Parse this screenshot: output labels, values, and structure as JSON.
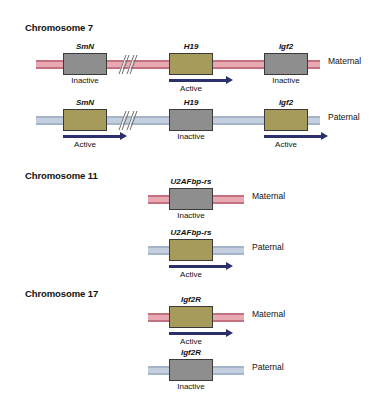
{
  "figure": {
    "background": "#ffffff",
    "colors": {
      "maternal_strand": "#e9a9b3",
      "maternal_strand_edge": "#c4727f",
      "paternal_strand": "#c3cedf",
      "paternal_strand_edge": "#a6b4c9",
      "active_gene_box": "#a79b5c",
      "inactive_gene_box": "#8e8e8e",
      "gene_box_border": "#3a3a3a",
      "arrow": "#2b2f6b",
      "text": "#111111"
    },
    "state_active": "Active",
    "state_inactive": "Inactive",
    "origin_maternal": "Maternal",
    "origin_paternal": "Paternal"
  },
  "sections": [
    {
      "heading": "Chromosome 7",
      "rows": [
        {
          "origin": "Maternal",
          "strand": "maternal",
          "has_break": true,
          "genes": [
            {
              "name": "SmN",
              "state": "Inactive",
              "arrow": false
            },
            {
              "name": "H19",
              "state": "Active",
              "arrow": true
            },
            {
              "name": "Igf2",
              "state": "Inactive",
              "arrow": false
            }
          ]
        },
        {
          "origin": "Paternal",
          "strand": "paternal",
          "has_break": true,
          "genes": [
            {
              "name": "SmN",
              "state": "Active",
              "arrow": true
            },
            {
              "name": "H19",
              "state": "Inactive",
              "arrow": false
            },
            {
              "name": "Igf2",
              "state": "Active",
              "arrow": true
            }
          ]
        }
      ]
    },
    {
      "heading": "Chromosome 11",
      "rows": [
        {
          "origin": "Maternal",
          "strand": "maternal",
          "has_break": false,
          "genes": [
            {
              "name": "U2AFbp-rs",
              "state": "Inactive",
              "arrow": false
            }
          ]
        },
        {
          "origin": "Paternal",
          "strand": "paternal",
          "has_break": false,
          "genes": [
            {
              "name": "U2AFbp-rs",
              "state": "Active",
              "arrow": true
            }
          ]
        }
      ]
    },
    {
      "heading": "Chromosome 17",
      "rows": [
        {
          "origin": "Maternal",
          "strand": "maternal",
          "has_break": false,
          "genes": [
            {
              "name": "Igf2R",
              "state": "Active",
              "arrow": true
            }
          ]
        },
        {
          "origin": "Paternal",
          "strand": "paternal",
          "has_break": false,
          "genes": [
            {
              "name": "Igf2R",
              "state": "Inactive",
              "arrow": false
            }
          ]
        }
      ]
    }
  ],
  "layout": {
    "headings": [
      {
        "x": 25,
        "y": 22
      },
      {
        "x": 25,
        "y": 170
      },
      {
        "x": 25,
        "y": 288
      }
    ],
    "rows": [
      {
        "y": 42,
        "strand_x": 36,
        "strand_w": 284,
        "origin_x": 328,
        "break_x": 118,
        "genes": [
          {
            "x": 63,
            "w": 44
          },
          {
            "x": 169,
            "w": 44
          },
          {
            "x": 264,
            "w": 44
          }
        ]
      },
      {
        "y": 98,
        "strand_x": 36,
        "strand_w": 284,
        "origin_x": 328,
        "break_x": 118,
        "genes": [
          {
            "x": 63,
            "w": 44
          },
          {
            "x": 169,
            "w": 44
          },
          {
            "x": 264,
            "w": 44
          }
        ]
      },
      {
        "y": 177,
        "strand_x": 148,
        "strand_w": 96,
        "origin_x": 252,
        "break_x": null,
        "genes": [
          {
            "x": 169,
            "w": 44
          }
        ]
      },
      {
        "y": 228,
        "strand_x": 148,
        "strand_w": 96,
        "origin_x": 252,
        "break_x": null,
        "genes": [
          {
            "x": 169,
            "w": 44
          }
        ]
      },
      {
        "y": 295,
        "strand_x": 148,
        "strand_w": 96,
        "origin_x": 252,
        "break_x": null,
        "genes": [
          {
            "x": 169,
            "w": 44
          }
        ]
      },
      {
        "y": 348,
        "strand_x": 148,
        "strand_w": 96,
        "origin_x": 252,
        "break_x": null,
        "genes": [
          {
            "x": 169,
            "w": 44
          }
        ]
      }
    ]
  }
}
